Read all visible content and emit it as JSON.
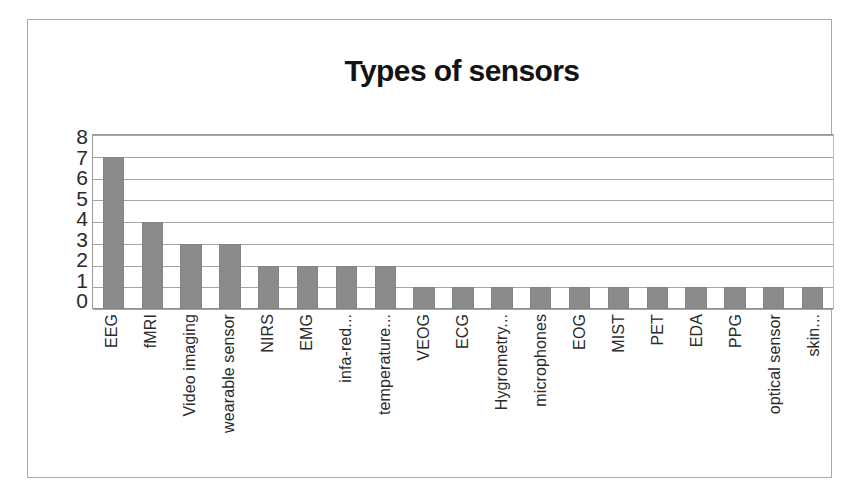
{
  "chart_data": {
    "type": "bar",
    "title": "Types of sensors",
    "xlabel": "",
    "ylabel": "",
    "ylim": [
      0,
      8
    ],
    "yticks": [
      "8",
      "7",
      "6",
      "5",
      "4",
      "3",
      "2",
      "1",
      "0"
    ],
    "grid": true,
    "legend": false,
    "bar_color": "#8b8b8b",
    "categories": [
      "EEG",
      "fMRI",
      "Video imaging",
      "wearable sensor",
      "NIRS",
      "EMG",
      "infa-red...",
      "temperature...",
      "VEOG",
      "ECG",
      "Hygrometry...",
      "microphones",
      "EOG",
      "MIST",
      "PET",
      "EDA",
      "PPG",
      "optical sensor",
      "skin..."
    ],
    "values": [
      7,
      4,
      3,
      3,
      2,
      2,
      2,
      2,
      1,
      1,
      1,
      1,
      1,
      1,
      1,
      1,
      1,
      1,
      1
    ]
  }
}
